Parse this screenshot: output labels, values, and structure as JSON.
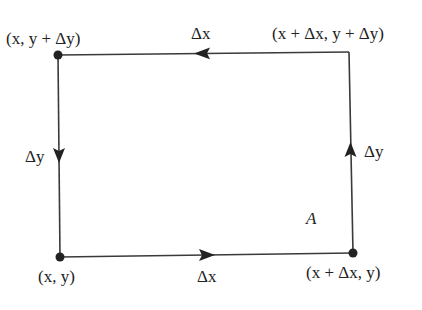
{
  "diagram": {
    "type": "rectangular circulation path",
    "colors": {
      "stroke": "#3a3a3a",
      "text": "#222222",
      "background": "#ffffff"
    },
    "vertices": [
      {
        "id": "bottom-left",
        "label": "(x, y)"
      },
      {
        "id": "bottom-right",
        "label": "(x + Δx, y)"
      },
      {
        "id": "top-right",
        "label": "(x + Δx, y + Δy)"
      },
      {
        "id": "top-left",
        "label": "(x, y + Δy)"
      }
    ],
    "edges": [
      {
        "id": "bottom",
        "label": "Δx",
        "direction": "right"
      },
      {
        "id": "right",
        "label": "Δy",
        "direction": "up"
      },
      {
        "id": "top",
        "label": "Δx",
        "direction": "left"
      },
      {
        "id": "left",
        "label": "Δy",
        "direction": "down"
      }
    ],
    "area_label": "A"
  }
}
